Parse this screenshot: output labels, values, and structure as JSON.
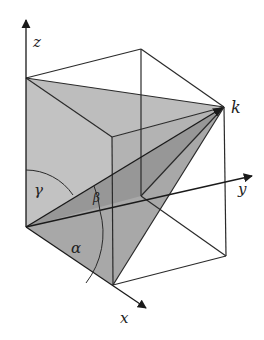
{
  "diagram": {
    "axes": {
      "x": {
        "label": "x"
      },
      "y": {
        "label": "y"
      },
      "z": {
        "label": "z"
      }
    },
    "point_label": "k",
    "angles": {
      "alpha": "α",
      "beta": "β",
      "gamma": "γ"
    },
    "colors": {
      "line": "#2a2a2a",
      "light_shade": "#c2c2c2",
      "mid_shade": "#a9a9a9",
      "dark_shade": "#8f8f8f",
      "background": "#ffffff"
    }
  }
}
